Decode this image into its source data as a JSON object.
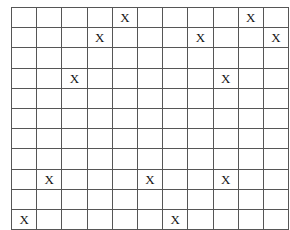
{
  "figure": {
    "name": "x-mark-grid",
    "rows": 11,
    "columns": 11,
    "mark_glyph": "X",
    "background_color": "#ffffff",
    "grid_line_color": "#565656",
    "mark_color": "#141414"
  },
  "chart_data": {
    "type": "heatmap",
    "title": "",
    "xlabel": "",
    "ylabel": "",
    "rows": 11,
    "columns": 11,
    "grid": true,
    "legend": "",
    "marked_cells": [
      {
        "row": 1,
        "col": 5
      },
      {
        "row": 1,
        "col": 10
      },
      {
        "row": 2,
        "col": 4
      },
      {
        "row": 2,
        "col": 8
      },
      {
        "row": 2,
        "col": 11
      },
      {
        "row": 4,
        "col": 3
      },
      {
        "row": 4,
        "col": 9
      },
      {
        "row": 9,
        "col": 2
      },
      {
        "row": 9,
        "col": 6
      },
      {
        "row": 9,
        "col": 9
      },
      {
        "row": 11,
        "col": 1
      },
      {
        "row": 11,
        "col": 7
      }
    ],
    "marked_count": 12,
    "cells": [
      [
        "",
        "",
        "",
        "",
        "X",
        "",
        "",
        "",
        "",
        "X",
        ""
      ],
      [
        "",
        "",
        "",
        "X",
        "",
        "",
        "",
        "X",
        "",
        "",
        "X"
      ],
      [
        "",
        "",
        "",
        "",
        "",
        "",
        "",
        "",
        "",
        "",
        ""
      ],
      [
        "",
        "",
        "X",
        "",
        "",
        "",
        "",
        "",
        "X",
        "",
        ""
      ],
      [
        "",
        "",
        "",
        "",
        "",
        "",
        "",
        "",
        "",
        "",
        ""
      ],
      [
        "",
        "",
        "",
        "",
        "",
        "",
        "",
        "",
        "",
        "",
        ""
      ],
      [
        "",
        "",
        "",
        "",
        "",
        "",
        "",
        "",
        "",
        "",
        ""
      ],
      [
        "",
        "",
        "",
        "",
        "",
        "",
        "",
        "",
        "",
        "",
        ""
      ],
      [
        "",
        "X",
        "",
        "",
        "",
        "X",
        "",
        "",
        "X",
        "",
        ""
      ],
      [
        "",
        "",
        "",
        "",
        "",
        "",
        "",
        "",
        "",
        "",
        ""
      ],
      [
        "X",
        "",
        "",
        "",
        "",
        "",
        "X",
        "",
        "",
        "",
        ""
      ]
    ]
  }
}
